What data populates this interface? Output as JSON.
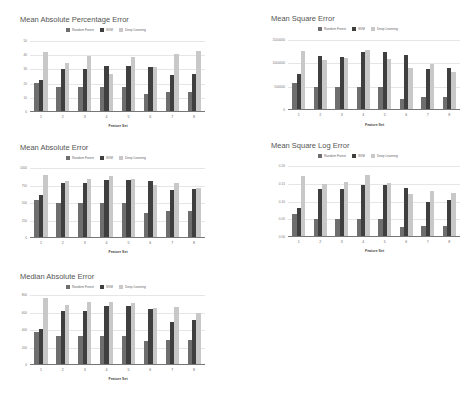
{
  "colors": {
    "Random Forest": "#6e6e6e",
    "SVM": "#3f3f3f",
    "Deep Learning": "#c8c8c8"
  },
  "legend": [
    "Random Forest",
    "SVM",
    "Deep Learning"
  ],
  "chart_data": [
    {
      "id": "mape",
      "type": "bar",
      "title": "Mean Absolute Percentage Error",
      "xlabel": "Feature Set",
      "ylabel": "",
      "categories": [
        "1",
        "2",
        "3",
        "4",
        "5",
        "6",
        "7",
        "8"
      ],
      "yticks": [
        "0",
        "10",
        "20",
        "30",
        "40",
        "50"
      ],
      "ylim": [
        0,
        50
      ],
      "grid": true,
      "legend_position": "top",
      "series": [
        {
          "name": "Random Forest",
          "values": [
            20.5,
            17.5,
            17.5,
            17.5,
            17.5,
            12.5,
            14,
            14
          ]
        },
        {
          "name": "SVM",
          "values": [
            22.5,
            30.5,
            30.5,
            32.5,
            32.5,
            31.5,
            26,
            26.5
          ]
        },
        {
          "name": "Deep Learning",
          "values": [
            42,
            34.5,
            39.5,
            26.5,
            39,
            31.5,
            41,
            43
          ]
        }
      ]
    },
    {
      "id": "mse",
      "type": "bar",
      "title": "Mean Square Error",
      "xlabel": "Feature Set",
      "ylabel": "",
      "categories": [
        "1",
        "2",
        "3",
        "4",
        "5",
        "6",
        "7",
        "8"
      ],
      "yticks": [
        "0",
        "500000",
        "1000000",
        "1500000"
      ],
      "ylim": [
        0,
        1500000
      ],
      "grid": true,
      "legend_position": "top",
      "series": [
        {
          "name": "Random Forest",
          "values": [
            580000,
            500000,
            500000,
            500000,
            500000,
            240000,
            270000,
            270000
          ]
        },
        {
          "name": "SVM",
          "values": [
            780000,
            1150000,
            1130000,
            1240000,
            1240000,
            1180000,
            880000,
            900000
          ]
        },
        {
          "name": "Deep Learning",
          "values": [
            1270000,
            1070000,
            1120000,
            1290000,
            1090000,
            900000,
            990000,
            820000
          ]
        }
      ]
    },
    {
      "id": "mae",
      "type": "bar",
      "title": "Mean Absolute Error",
      "xlabel": "Feature Set",
      "ylabel": "",
      "categories": [
        "1",
        "2",
        "3",
        "4",
        "5",
        "6",
        "7",
        "8"
      ],
      "yticks": [
        "0",
        "250",
        "500",
        "750",
        "1000"
      ],
      "ylim": [
        0,
        1000
      ],
      "grid": true,
      "legend_position": "top",
      "series": [
        {
          "name": "Random Forest",
          "values": [
            550,
            500,
            500,
            500,
            500,
            360,
            380,
            380
          ]
        },
        {
          "name": "SVM",
          "values": [
            610,
            780,
            780,
            830,
            830,
            810,
            680,
            700
          ]
        },
        {
          "name": "Deep Learning",
          "values": [
            900,
            820,
            840,
            880,
            840,
            760,
            780,
            720
          ]
        }
      ]
    },
    {
      "id": "msle",
      "type": "bar",
      "title": "Mean Square Log Error",
      "xlabel": "Feature Set",
      "ylabel": "",
      "categories": [
        "1",
        "2",
        "3",
        "4",
        "5",
        "6",
        "7",
        "8"
      ],
      "yticks": [
        "0.00",
        "0.05",
        "0.10",
        "0.15",
        "0.20"
      ],
      "ylim": [
        0,
        0.2
      ],
      "grid": true,
      "legend_position": "top",
      "series": [
        {
          "name": "Random Forest",
          "values": [
            0.065,
            0.051,
            0.051,
            0.051,
            0.051,
            0.029,
            0.031,
            0.032
          ]
        },
        {
          "name": "SVM",
          "values": [
            0.082,
            0.135,
            0.134,
            0.146,
            0.146,
            0.139,
            0.099,
            0.104
          ]
        },
        {
          "name": "Deep Learning",
          "values": [
            0.172,
            0.148,
            0.156,
            0.175,
            0.151,
            0.12,
            0.131,
            0.123
          ]
        }
      ]
    },
    {
      "id": "medae",
      "type": "bar",
      "title": "Median Absolute Error",
      "xlabel": "Feature Set",
      "ylabel": "",
      "categories": [
        "1",
        "2",
        "3",
        "4",
        "5",
        "6",
        "7",
        "8"
      ],
      "yticks": [
        "0",
        "200",
        "400",
        "600",
        "800"
      ],
      "ylim": [
        0,
        800
      ],
      "grid": true,
      "legend_position": "top",
      "series": [
        {
          "name": "Random Forest",
          "values": [
            380,
            330,
            330,
            330,
            330,
            280,
            290,
            290
          ]
        },
        {
          "name": "SVM",
          "values": [
            410,
            620,
            620,
            670,
            670,
            640,
            490,
            510
          ]
        },
        {
          "name": "Deep Learning",
          "values": [
            770,
            690,
            720,
            720,
            710,
            650,
            660,
            600
          ]
        }
      ]
    }
  ]
}
